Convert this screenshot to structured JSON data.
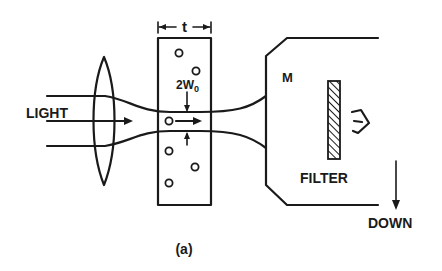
{
  "figure": {
    "caption": "(a)",
    "labels": {
      "light": "LIGHT",
      "thickness": "t",
      "beam_waist": "2W",
      "beam_waist_sub": "0",
      "detector": "M",
      "filter": "FILTER",
      "direction": "DOWN"
    },
    "components": [
      {
        "name": "lens",
        "description": "converging lens focusing incoming light"
      },
      {
        "name": "sample-cell",
        "description": "cell of thickness t containing suspended particles"
      },
      {
        "name": "beam",
        "description": "focused Gaussian beam with waist 2W0 inside cell"
      },
      {
        "name": "detector-housing",
        "description": "observation chamber M"
      },
      {
        "name": "filter",
        "description": "hatched optical filter"
      },
      {
        "name": "eye",
        "description": "observer viewing through filter"
      }
    ],
    "colors": {
      "ink": "#1a1a1a",
      "background": "#ffffff"
    }
  }
}
